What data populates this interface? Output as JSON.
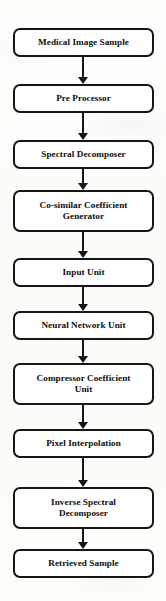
{
  "diagram": {
    "type": "flowchart",
    "orientation": "top-to-bottom",
    "colors": {
      "background": "#fdfdfb",
      "box_fill": "#ffffff",
      "box_border": "#16161a",
      "text": "#0d0d10",
      "arrow": "#16161a"
    },
    "nodes": [
      {
        "id": "medical-image-sample",
        "label": "Medical Image Sample",
        "lines": 1,
        "x": 13,
        "y": 28,
        "w": 141,
        "h": 29
      },
      {
        "id": "pre-processor",
        "label": "Pre Processor",
        "lines": 1,
        "x": 13,
        "y": 84,
        "w": 141,
        "h": 29
      },
      {
        "id": "spectral-decomposer",
        "label": "Spectral Decomposer",
        "lines": 1,
        "x": 13,
        "y": 140,
        "w": 141,
        "h": 29
      },
      {
        "id": "co-similar-coefficient-generator",
        "label": "Co-similar Coefficient\nGenerator",
        "lines": 2,
        "x": 13,
        "y": 190,
        "w": 141,
        "h": 42
      },
      {
        "id": "input-unit",
        "label": "Input Unit",
        "lines": 1,
        "x": 13,
        "y": 258,
        "w": 141,
        "h": 29
      },
      {
        "id": "neural-network-unit",
        "label": "Neural Network Unit",
        "lines": 1,
        "x": 13,
        "y": 311,
        "w": 141,
        "h": 29
      },
      {
        "id": "compressor-coefficient-unit",
        "label": "Compressor Coefficient\nUnit",
        "lines": 2,
        "x": 13,
        "y": 363,
        "w": 141,
        "h": 42
      },
      {
        "id": "pixel-interpolation",
        "label": "Pixel Interpolation",
        "lines": 1,
        "x": 13,
        "y": 429,
        "w": 141,
        "h": 29
      },
      {
        "id": "inverse-spectral-decomposer",
        "label": "Inverse Spectral\nDecomposer",
        "lines": 2,
        "x": 13,
        "y": 487,
        "w": 141,
        "h": 42
      },
      {
        "id": "retrieved-sample",
        "label": "Retrieved Sample",
        "lines": 1,
        "x": 13,
        "y": 549,
        "w": 141,
        "h": 29
      }
    ],
    "edges": [
      {
        "id": "edge-1",
        "from": "medical-image-sample",
        "to": "pre-processor",
        "y": 57,
        "length": 27,
        "arrowhead": "solid-triangle"
      },
      {
        "id": "edge-2",
        "from": "pre-processor",
        "to": "spectral-decomposer",
        "y": 113,
        "length": 27,
        "arrowhead": "solid-triangle"
      },
      {
        "id": "edge-3",
        "from": "spectral-decomposer",
        "to": "co-similar-coefficient-generator",
        "y": 169,
        "length": 21,
        "arrowhead": "solid-triangle"
      },
      {
        "id": "edge-4",
        "from": "co-similar-coefficient-generator",
        "to": "input-unit",
        "y": 232,
        "length": 26,
        "arrowhead": "solid-triangle"
      },
      {
        "id": "edge-5",
        "from": "input-unit",
        "to": "neural-network-unit",
        "y": 287,
        "length": 24,
        "arrowhead": "solid-triangle"
      },
      {
        "id": "edge-6",
        "from": "neural-network-unit",
        "to": "compressor-coefficient-unit",
        "y": 340,
        "length": 23,
        "arrowhead": "solid-triangle"
      },
      {
        "id": "edge-7",
        "from": "compressor-coefficient-unit",
        "to": "pixel-interpolation",
        "y": 405,
        "length": 24,
        "arrowhead": "solid-triangle"
      },
      {
        "id": "edge-8",
        "from": "pixel-interpolation",
        "to": "inverse-spectral-decomposer",
        "y": 458,
        "length": 29,
        "arrowhead": "solid-triangle"
      },
      {
        "id": "edge-9",
        "from": "inverse-spectral-decomposer",
        "to": "retrieved-sample",
        "y": 529,
        "length": 20,
        "arrowhead": "solid-triangle"
      }
    ]
  }
}
